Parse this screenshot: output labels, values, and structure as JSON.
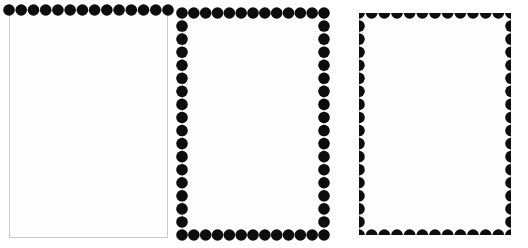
{
  "figure": {
    "canvas": {
      "width": 528,
      "height": 248
    },
    "background_color": "#ffffff",
    "dot_color": "#0d0d0d",
    "frame_color": "#c9c9c9",
    "panel_fill": "#fefefe",
    "dot_diameter": 11.5,
    "dot_spacing": 11.6
  },
  "panels": [
    {
      "id": "panel-1",
      "name": "top-edge-dots-panel",
      "label": "",
      "x": 9,
      "y": 10,
      "width": 159,
      "height": 228,
      "edges": {
        "top": true,
        "right": false,
        "bottom": false,
        "left": false
      },
      "dot_mode": "centered-on-edge",
      "clipped": false,
      "dots_top": 14,
      "dots_right": 0,
      "dots_bottom": 0,
      "dots_left": 0,
      "dot_radius": 5.8,
      "dot_step": 11.6
    },
    {
      "id": "panel-2",
      "name": "full-border-dots-panel",
      "label": "",
      "x": 182,
      "y": 13,
      "width": 142,
      "height": 222,
      "edges": {
        "top": true,
        "right": true,
        "bottom": true,
        "left": true
      },
      "dot_mode": "centered-on-edge",
      "clipped": false,
      "dots_top": 13,
      "dots_right": 18,
      "dots_bottom": 13,
      "dots_left": 18,
      "dot_radius": 5.8,
      "dot_step": 11.6
    },
    {
      "id": "panel-3",
      "name": "clipped-border-dots-panel",
      "label": "",
      "x": 359,
      "y": 13,
      "width": 152,
      "height": 222,
      "edges": {
        "top": true,
        "right": true,
        "bottom": true,
        "left": true
      },
      "dot_mode": "clipped-half-circles",
      "clipped": true,
      "dots_top": 13,
      "dots_right": 18,
      "dots_bottom": 13,
      "dots_left": 18,
      "dot_radius": 5.8,
      "dot_step": 11.6
    }
  ]
}
